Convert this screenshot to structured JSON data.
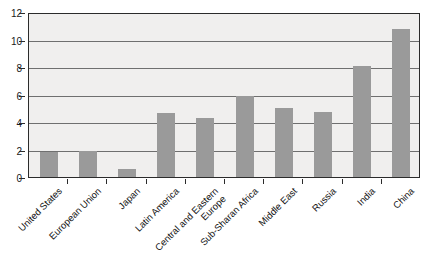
{
  "chart_data": {
    "type": "bar",
    "title": "",
    "xlabel": "",
    "ylabel": "",
    "ylim": [
      0,
      12
    ],
    "yticks": [
      0,
      2,
      4,
      6,
      8,
      10,
      12
    ],
    "grid": true,
    "legend": "none",
    "bar_color": "#9a9a9a",
    "plot_background": "#f0efee",
    "axis_color": "#2b2b2b",
    "categories": [
      "United States",
      "European Union",
      "Japan",
      "Latin America",
      "Central and Eastern\nEurope",
      "Sub-Sharan Africa",
      "Middle East",
      "Russia",
      "India",
      "China"
    ],
    "values": [
      1.8,
      1.9,
      0.6,
      4.65,
      4.3,
      5.9,
      5.0,
      4.75,
      8.05,
      10.8
    ]
  }
}
